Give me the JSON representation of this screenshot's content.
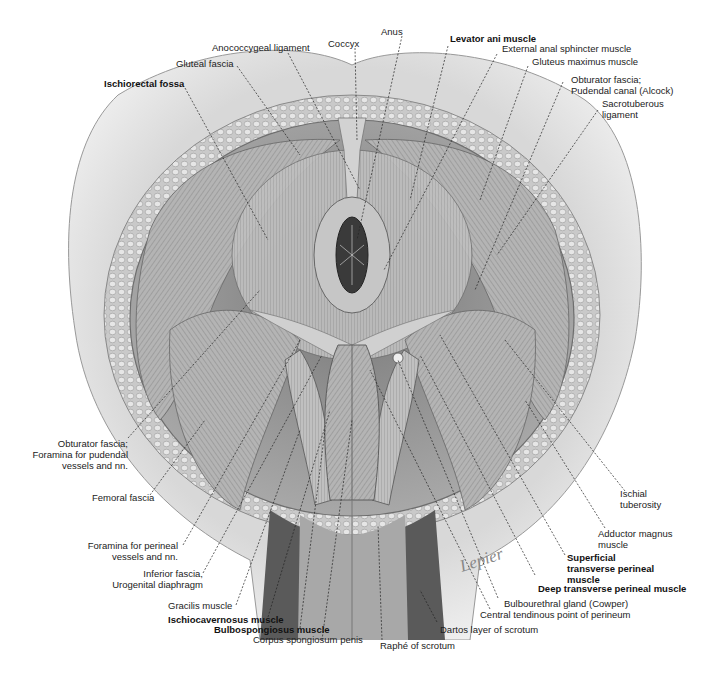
{
  "figure": {
    "colors": {
      "background": "#ffffff",
      "skin": "#e4e4e4",
      "fat": "#cfcfcf",
      "muscle": "#9a9a9a",
      "dark_muscle": "#4a4a4a",
      "label": "#222222"
    }
  },
  "labels": {
    "top": [
      {
        "id": "ischiorectal-fossa",
        "text": "Ischiorectal fossa",
        "bold": true
      },
      {
        "id": "gluteal-fascia",
        "text": "Gluteal fascia",
        "bold": false
      },
      {
        "id": "anococcygeal-ligament",
        "text": "Anococcygeal ligament",
        "bold": false
      },
      {
        "id": "coccyx",
        "text": "Coccyx",
        "bold": false
      },
      {
        "id": "anus",
        "text": "Anus",
        "bold": false
      },
      {
        "id": "levator-ani-muscle",
        "text": "Levator ani muscle",
        "bold": true
      },
      {
        "id": "external-anal-sphincter-muscle",
        "text": "External anal sphincter muscle",
        "bold": false
      },
      {
        "id": "gluteus-maximus-muscle",
        "text": "Gluteus maximus muscle",
        "bold": false
      },
      {
        "id": "obturator-fascia-pudendal-canal",
        "line1": "Obturator fascia;",
        "line2": "Pudendal canal (Alcock)",
        "bold": false
      },
      {
        "id": "sacrotuberous-ligament",
        "line1": "Sacrotuberous",
        "line2": "ligament",
        "bold": false
      }
    ],
    "left": [
      {
        "id": "obturator-fascia-foramina",
        "line1": "Obturator fascia;",
        "line2": "Foramina for pudendal",
        "line3": "vessels and nn.",
        "bold": false
      },
      {
        "id": "femoral-fascia",
        "text": "Femoral fascia",
        "bold": false
      },
      {
        "id": "foramina-perineal",
        "line1": "Foramina for perineal",
        "line2": "vessels and nn.",
        "bold": false
      },
      {
        "id": "inferior-fascia",
        "line1": "Inferior fascia,",
        "line2": "Urogenital diaphragm",
        "bold": false
      },
      {
        "id": "gracilis-muscle",
        "text": "Gracilis muscle",
        "bold": false
      },
      {
        "id": "ischiocavernosus-muscle",
        "text": "Ischiocavernosus muscle",
        "bold": true
      },
      {
        "id": "bulbospongiosus-muscle",
        "text": "Bulbospongiosus muscle",
        "bold": true
      },
      {
        "id": "corpus-spongiosum-penis",
        "text": "Corpus spongiosum penis",
        "bold": false
      }
    ],
    "bottom": [
      {
        "id": "raphe-of-scrotum",
        "text": "Raphé of scrotum",
        "bold": false
      },
      {
        "id": "dartos-layer",
        "text": "Dartos layer of scrotum",
        "bold": false
      },
      {
        "id": "central-tendinous-point",
        "text": "Central tendinous point of perineum",
        "bold": false
      },
      {
        "id": "bulbourethral-gland",
        "text": "Bulbourethral gland (Cowper)",
        "bold": false
      }
    ],
    "right": [
      {
        "id": "ischial-tuberosity",
        "line1": "Ischial",
        "line2": "tuberosity",
        "bold": false
      },
      {
        "id": "adductor-magnus-muscle",
        "line1": "Adductor magnus",
        "line2": "muscle",
        "bold": false
      },
      {
        "id": "superficial-transverse-perineal",
        "line1": "Superficial",
        "line2": "transverse perineal",
        "line3": "muscle",
        "bold": true
      },
      {
        "id": "deep-transverse-perineal",
        "text": "Deep transverse perineal muscle",
        "bold": true
      }
    ]
  },
  "signature": "Lepier"
}
